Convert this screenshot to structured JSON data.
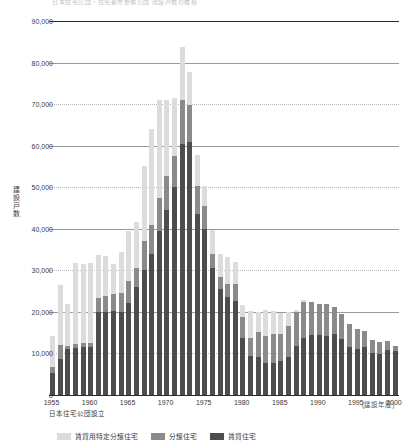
{
  "top_caption": "日本住宅公団・住宅都市整備公団 建設戸数の推移",
  "note": "日本住宅公団設立",
  "axis": {
    "y_title": "建設戸数",
    "x_unit": "(建設年度)",
    "y_ticks": [
      "0",
      "10,000",
      "20,000",
      "30,000",
      "40,000",
      "50,000",
      "60,000",
      "70,000",
      "80,000",
      "90,000"
    ],
    "x_ticks": [
      "1955",
      "1960",
      "1965",
      "1970",
      "1975",
      "1980",
      "1985",
      "1990",
      "1995",
      "2000"
    ]
  },
  "legend": [
    {
      "label": "賃貸用特定分譲住宅",
      "color": "#dcdcdc",
      "key": "tokutei_bunjo"
    },
    {
      "label": "分譲住宅",
      "color": "#8a8a8a",
      "key": "bunjo"
    },
    {
      "label": "賃貸住宅",
      "color": "#4d4d4d",
      "key": "chintai"
    }
  ],
  "chart_data": {
    "type": "bar",
    "stacked": true,
    "title": "日本住宅公団・住宅都市整備公団 建設戸数の推移",
    "xlabel": "(建設年度)",
    "ylabel": "建設戸数",
    "ylim": [
      0,
      90000
    ],
    "ytick_step": 10000,
    "grid": true,
    "legend_position": "bottom",
    "categories": [
      "1955",
      "1956",
      "1957",
      "1958",
      "1959",
      "1960",
      "1961",
      "1962",
      "1963",
      "1964",
      "1965",
      "1966",
      "1967",
      "1968",
      "1969",
      "1970",
      "1971",
      "1972",
      "1973",
      "1974",
      "1975",
      "1976",
      "1977",
      "1978",
      "1979",
      "1980",
      "1981",
      "1982",
      "1983",
      "1984",
      "1985",
      "1986",
      "1987",
      "1988",
      "1989",
      "1990",
      "1991",
      "1992",
      "1993",
      "1994",
      "1995",
      "1996",
      "1997",
      "1998",
      "1999",
      "2000"
    ],
    "series": [
      {
        "name": "賃貸住宅",
        "color": "#4d4d4d",
        "values": [
          5200,
          8600,
          11000,
          11400,
          11600,
          11500,
          19900,
          20000,
          20100,
          20000,
          22100,
          26000,
          30200,
          33900,
          39500,
          44500,
          50100,
          60400,
          60800,
          43600,
          40000,
          30500,
          25400,
          23600,
          22600,
          13700,
          9300,
          9200,
          7700,
          7800,
          8100,
          9100,
          11700,
          13800,
          14500,
          14400,
          14300,
          14600,
          13600,
          11500,
          11000,
          11500,
          10000,
          9900,
          10900,
          10700
        ]
      },
      {
        "name": "分譲住宅",
        "color": "#8a8a8a",
        "values": [
          1500,
          3400,
          800,
          900,
          1000,
          1100,
          3400,
          3800,
          4200,
          4500,
          5400,
          4600,
          6800,
          7100,
          8000,
          8100,
          7500,
          10600,
          9000,
          6600,
          5400,
          3400,
          3100,
          3200,
          4200,
          5100,
          4500,
          6000,
          6500,
          7000,
          6500,
          7500,
          8200,
          8700,
          7900,
          7600,
          7500,
          6700,
          6000,
          5500,
          4800,
          3800,
          3200,
          2900,
          2200,
          1000
        ]
      },
      {
        "name": "賃貸用特定分譲住宅",
        "color": "#dcdcdc",
        "values": [
          7500,
          14500,
          10200,
          19500,
          19000,
          19100,
          10500,
          9600,
          7300,
          9800,
          12000,
          11000,
          18200,
          22900,
          23600,
          18500,
          13800,
          12800,
          7900,
          7500,
          4800,
          5700,
          5500,
          6400,
          5200,
          2900,
          6400,
          4700,
          6300,
          5400,
          5200,
          3500,
          500,
          300,
          0,
          0,
          0,
          0,
          0,
          0,
          0,
          0,
          0,
          0,
          0,
          0
        ]
      }
    ]
  }
}
